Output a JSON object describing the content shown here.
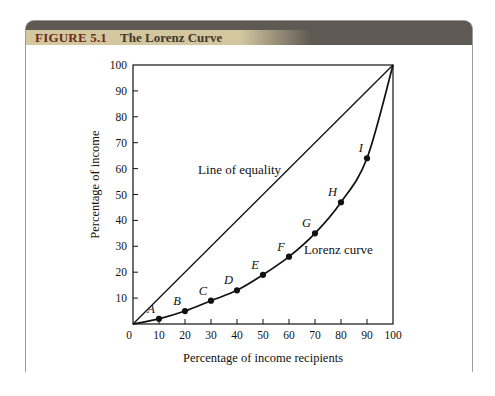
{
  "figure_header": {
    "label": "FIGURE 5.1",
    "title": "The Lorenz Curve"
  },
  "chart_data": {
    "type": "line",
    "title": "The Lorenz Curve",
    "xlabel": "Percentage of income recipients",
    "ylabel": "Percentage of income",
    "xlim": [
      0,
      100
    ],
    "ylim": [
      0,
      100
    ],
    "x_ticks": [
      0,
      10,
      20,
      30,
      40,
      50,
      60,
      70,
      80,
      90,
      100
    ],
    "y_ticks": [
      10,
      20,
      30,
      40,
      50,
      60,
      70,
      80,
      90,
      100
    ],
    "grid": false,
    "frame": "box",
    "legend_position": "inline-annotations",
    "series": [
      {
        "name": "Line of equality",
        "shape": "straight",
        "points": [
          [
            0,
            0
          ],
          [
            100,
            100
          ]
        ]
      },
      {
        "name": "Lorenz curve",
        "shape": "smooth",
        "points": [
          [
            0,
            0
          ],
          [
            10,
            2
          ],
          [
            20,
            5
          ],
          [
            30,
            9
          ],
          [
            40,
            13
          ],
          [
            50,
            19
          ],
          [
            60,
            26
          ],
          [
            70,
            35
          ],
          [
            80,
            47
          ],
          [
            90,
            64
          ],
          [
            100,
            100
          ]
        ]
      }
    ],
    "labeled_points": [
      {
        "label": "A",
        "x": 10,
        "y": 2
      },
      {
        "label": "B",
        "x": 20,
        "y": 5
      },
      {
        "label": "C",
        "x": 30,
        "y": 9
      },
      {
        "label": "D",
        "x": 40,
        "y": 13
      },
      {
        "label": "E",
        "x": 50,
        "y": 19
      },
      {
        "label": "F",
        "x": 60,
        "y": 26
      },
      {
        "label": "G",
        "x": 70,
        "y": 35
      },
      {
        "label": "H",
        "x": 80,
        "y": 47
      },
      {
        "label": "I",
        "x": 90,
        "y": 64
      }
    ],
    "annotations": [
      {
        "text": "Line of equality",
        "x": 41,
        "y": 58
      },
      {
        "text": "Lorenz curve",
        "x": 79,
        "y": 27
      }
    ]
  },
  "colors": {
    "header_bar": "#5f5954",
    "header_plate": "#d3c7a0",
    "figure_label_text": "#6e2a1a",
    "figure_title_text": "#43362a",
    "card_border": "#9c9c9c",
    "ink": "#111111"
  }
}
